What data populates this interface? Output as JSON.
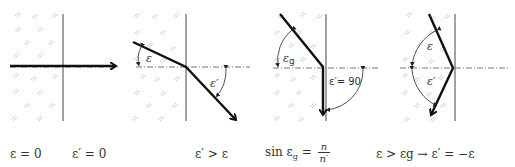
{
  "panels": [
    {
      "id": "normal-incidence",
      "labels": {
        "incidence": "ε = 0",
        "refraction": "ε′ = 0"
      }
    },
    {
      "id": "oblique-refraction",
      "angle_labels": {
        "incidence": "ε",
        "refraction": "ε′"
      },
      "condition": "ε′ > ε"
    },
    {
      "id": "critical-angle",
      "angle_labels": {
        "incidence": "εg",
        "refraction": "ε′= 90"
      },
      "condition": {
        "lhs": "sin ε",
        "lhs_sub": "g",
        "eq": "=",
        "num": "n",
        "den": "n′"
      }
    },
    {
      "id": "total-internal-reflection",
      "angle_labels": {
        "incidence": "ε",
        "reflection": "ε′"
      },
      "condition": "ε > εg → ε′ = −ε"
    }
  ],
  "colors": {
    "ray": "#111111",
    "interface": "#444444",
    "axis": "#777777",
    "hatch": "#bdbdbd",
    "text": "#333333"
  }
}
